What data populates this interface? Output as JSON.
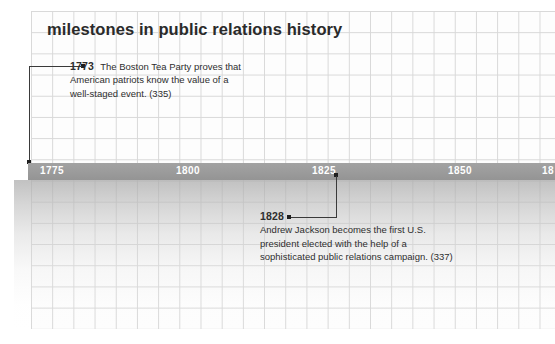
{
  "title": "milestones in public relations history",
  "timeline": {
    "ticks": [
      {
        "label": "1775"
      },
      {
        "label": "1800"
      },
      {
        "label": "1825"
      },
      {
        "label": "1850"
      },
      {
        "label": "18"
      }
    ],
    "bar_color": "#9b9b9b",
    "tick_text_color": "#ffffff"
  },
  "entries": [
    {
      "year": "1773",
      "line1": "The Boston Tea Party proves that",
      "line2": "American patriots know the value of a",
      "line3": "well-staged event. (335)",
      "page_ref": "(335)"
    },
    {
      "year": "1828",
      "line1": "Andrew Jackson becomes the first U.S.",
      "line2": "president elected with the help of a",
      "line3": "sophisticated public relations campaign. (337)",
      "page_ref": "(337)"
    }
  ]
}
